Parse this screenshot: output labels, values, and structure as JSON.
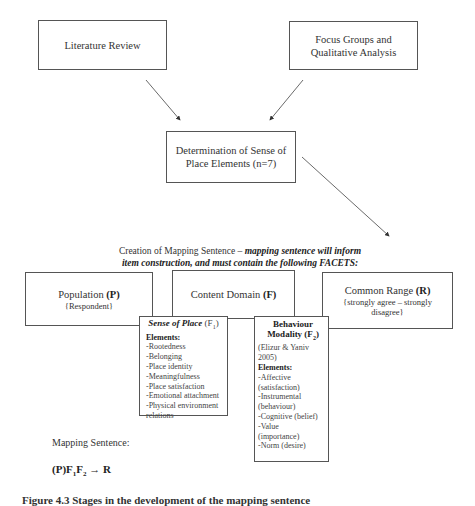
{
  "nodes": {
    "literature_review": "Literature Review",
    "focus_groups": [
      "Focus Groups and",
      "Qualitative Analysis"
    ],
    "determination": [
      "Determination of Sense of",
      "Place Elements (n=7)"
    ],
    "creation_label": {
      "plain": "Creation of Mapping Sentence – ",
      "italic_bold_1": "mapping sentence will inform",
      "italic_bold_2": "item construction, and must contain the following FACETS:"
    },
    "population": {
      "title": "Population ",
      "symbol": "(P)",
      "sub": "{Respondent}"
    },
    "content_domain": {
      "title": "Content Domain ",
      "symbol": "(F)"
    },
    "common_range": {
      "title": "Common Range ",
      "symbol": "(R)",
      "sub": [
        "{strongly agree – strongly",
        "disagree}"
      ]
    },
    "sense_of_place": {
      "title": "Sense of Place ",
      "symbol": "(F",
      "sub_index": "1",
      "close": ")",
      "elements_label": "Elements:",
      "elements": [
        "-Rootedness",
        "-Belonging",
        "-Place identity",
        "-Meaningfulness",
        "-Place satisfaction",
        "-Emotional attachment",
        "-Physical environment",
        "relations"
      ]
    },
    "behaviour_modality": {
      "title_1": "Behaviour",
      "title_2": "Modality (F",
      "sub_index": "2",
      "close": ")",
      "citation": [
        "(Elizur & Yaniv",
        "2005)"
      ],
      "elements_label": "Elements:",
      "elements": [
        "-Affective",
        "(satisfaction)",
        "-Instrumental",
        "(behaviour)",
        "-Cognitive (belief)",
        "-Value",
        "(importance)",
        "-Norm (desire)"
      ]
    }
  },
  "mapping_sentence": {
    "label": "Mapping Sentence:",
    "formula": {
      "p": "(P)F",
      "i1": "1",
      "f2": "F",
      "i2": "2",
      "arrow": " → R"
    }
  },
  "caption_clipped": "Figure 4.3   Stages in the development of the mapping sentence"
}
